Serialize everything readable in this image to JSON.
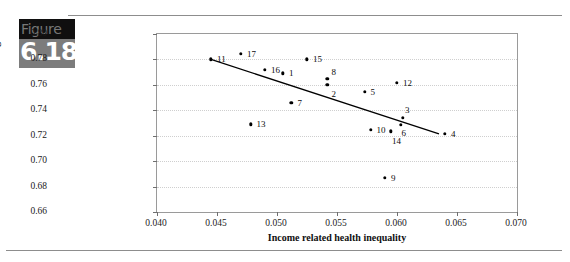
{
  "figure": {
    "word": "Figure",
    "number": "6.18"
  },
  "chart_data": {
    "type": "scatter",
    "title": "",
    "xlabel": "Income related health inequality",
    "ylabel": "Average health",
    "xlim": [
      0.04,
      0.07
    ],
    "ylim": [
      0.66,
      0.8
    ],
    "xticks": [
      "0.040",
      "0.045",
      "0.050",
      "0.055",
      "0.060",
      "0.065",
      "0.070"
    ],
    "xtick_values": [
      0.04,
      0.045,
      0.05,
      0.055,
      0.06,
      0.065,
      0.07
    ],
    "yticks": [
      "0.66",
      "0.68",
      "0.70",
      "0.72",
      "0.74",
      "0.76",
      "0.78",
      "0.80"
    ],
    "ytick_values": [
      0.66,
      0.68,
      0.7,
      0.72,
      0.74,
      0.76,
      0.78,
      0.8
    ],
    "grid": true,
    "legend": "none",
    "points": [
      {
        "label": "11",
        "x": 0.0445,
        "y": 0.78,
        "lx": 6,
        "ly": -4
      },
      {
        "label": "17",
        "x": 0.047,
        "y": 0.7845,
        "lx": 6,
        "ly": -4
      },
      {
        "label": "16",
        "x": 0.049,
        "y": 0.772,
        "lx": 6,
        "ly": -4
      },
      {
        "label": "1",
        "x": 0.0505,
        "y": 0.769,
        "lx": 6,
        "ly": -4
      },
      {
        "label": "15",
        "x": 0.0525,
        "y": 0.78,
        "lx": 6,
        "ly": -4
      },
      {
        "label": "7",
        "x": 0.0512,
        "y": 0.746,
        "lx": 6,
        "ly": -4
      },
      {
        "label": "13",
        "x": 0.0478,
        "y": 0.729,
        "lx": 6,
        "ly": -4
      },
      {
        "label": "8",
        "x": 0.0542,
        "y": 0.765,
        "lx": 4,
        "ly": -11
      },
      {
        "label": "2",
        "x": 0.0542,
        "y": 0.76,
        "lx": 4,
        "ly": 5
      },
      {
        "label": "5",
        "x": 0.0573,
        "y": 0.7545,
        "lx": 6,
        "ly": -4
      },
      {
        "label": "12",
        "x": 0.06,
        "y": 0.7615,
        "lx": 6,
        "ly": -4
      },
      {
        "label": "3",
        "x": 0.0605,
        "y": 0.734,
        "lx": 2,
        "ly": -12
      },
      {
        "label": "6",
        "x": 0.0603,
        "y": 0.7285,
        "lx": 1,
        "ly": 4
      },
      {
        "label": "10",
        "x": 0.0578,
        "y": 0.7245,
        "lx": 6,
        "ly": -4
      },
      {
        "label": "14",
        "x": 0.0595,
        "y": 0.7235,
        "lx": 1,
        "ly": 6
      },
      {
        "label": "4",
        "x": 0.064,
        "y": 0.7215,
        "lx": 6,
        "ly": -4
      },
      {
        "label": "9",
        "x": 0.059,
        "y": 0.687,
        "lx": 6,
        "ly": -4
      }
    ],
    "trend_line": {
      "x0": 0.0445,
      "y0": 0.78,
      "x1": 0.0635,
      "y1": 0.7215
    }
  }
}
